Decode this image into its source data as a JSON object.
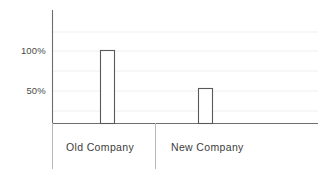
{
  "chart_data": {
    "type": "bar",
    "title": "",
    "subtitle": "",
    "xlabel": "",
    "ylabel": "",
    "categories": [
      "Old Company",
      "New Company"
    ],
    "values": [
      100,
      48
    ],
    "value_unit": "%",
    "series": [
      {
        "name": "",
        "values": [
          100,
          48
        ]
      }
    ],
    "ylim": [
      0,
      190
    ],
    "yticks": [
      50,
      100
    ],
    "ytick_labels": [
      "50%",
      "100%"
    ],
    "grid": true,
    "grid_axis": "y",
    "legend": "none",
    "bar_style": "outlined",
    "annotations": []
  },
  "axis": {
    "y_tick_labels": [
      {
        "id": "tick-100",
        "text": "100%",
        "value": 100
      },
      {
        "id": "tick-50",
        "text": "50%",
        "value": 50
      }
    ]
  },
  "categories": [
    {
      "id": "cat-old",
      "label": "Old Company",
      "value": 100
    },
    {
      "id": "cat-new",
      "label": "New Company",
      "value": 48
    }
  ],
  "colors": {
    "background": "#ffffff",
    "axis_line": "#6e6e6e",
    "baseline": "#6e6e6e",
    "gridline": "#eceff1",
    "bar_outline": "#595959",
    "bar_fill": "#ffffff",
    "separator": "#b9b9b9",
    "tick_text": "#4a4a4a",
    "category_text": "#3d3d3d"
  }
}
